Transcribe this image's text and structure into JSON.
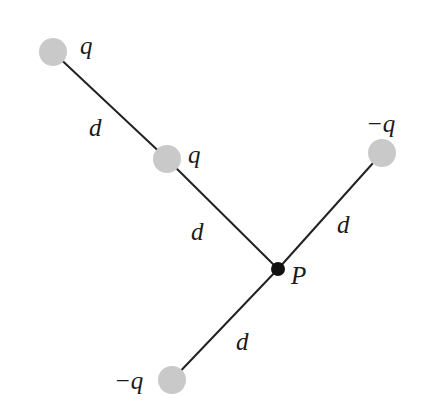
{
  "figure": {
    "colors": {
      "charge_fill": "#c9c9c9",
      "point_fill": "#111111",
      "line": "#222222",
      "text": "#1a1a1a"
    },
    "point_P": {
      "label": "P"
    },
    "charges": [
      {
        "id": "charge-top-left",
        "label": "q",
        "sign": "positive"
      },
      {
        "id": "charge-middle",
        "label": "q",
        "sign": "positive"
      },
      {
        "id": "charge-upper-right",
        "label": "−q",
        "sign": "negative"
      },
      {
        "id": "charge-bottom",
        "label": "−q",
        "sign": "negative"
      }
    ],
    "segments": [
      {
        "id": "segment-top-left-to-middle",
        "label": "d"
      },
      {
        "id": "segment-middle-to-P",
        "label": "d"
      },
      {
        "id": "segment-P-to-upper-right",
        "label": "d"
      },
      {
        "id": "segment-P-to-bottom",
        "label": "d"
      }
    ]
  }
}
